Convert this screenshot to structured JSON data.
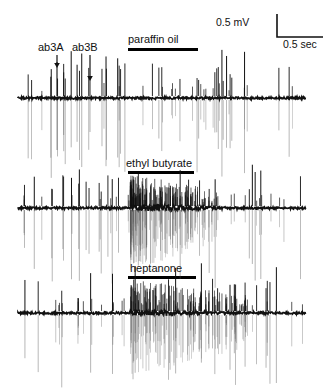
{
  "figure": {
    "title_visible": false,
    "background": "#ffffff",
    "trace_color": "#111111"
  },
  "scale_bar": {
    "voltage_label": "0.5 mV",
    "time_label": "0.5 sec",
    "voltage_value": 0.5,
    "voltage_unit": "mV",
    "time_value": 0.5,
    "time_unit": "sec"
  },
  "neuron_labels": [
    {
      "label": "ab3A",
      "name": "ab3A"
    },
    {
      "label": "ab3B",
      "name": "ab3B"
    }
  ],
  "traces": [
    {
      "id": "trace-paraffin-oil",
      "stimulus": "paraffin oil",
      "index": 1,
      "response": "no increase in firing; baseline spontaneous activity maintained"
    },
    {
      "id": "trace-ethyl-butyrate",
      "stimulus": "ethyl butyrate",
      "index": 2,
      "response": "strong transient burst of high-frequency spikes at stimulus onset"
    },
    {
      "id": "trace-heptanone",
      "stimulus": "heptanone",
      "index": 3,
      "response": "sustained dense high-frequency firing during and after stimulus"
    }
  ],
  "chart_data": {
    "type": "line",
    "title": "",
    "xlabel": "",
    "ylabel": "",
    "subtitle": "",
    "legend": [],
    "grid": false,
    "x_scale": {
      "label": "0.5 sec",
      "value": 0.5,
      "unit": "sec"
    },
    "y_scale": {
      "label": "0.5 mV",
      "value": 0.5,
      "unit": "mV"
    },
    "series": [
      {
        "name": "paraffin oil",
        "stimulus_onset_fraction": 0.39,
        "stimulus_offset_fraction": 0.63,
        "burst": false,
        "burst_intensity": 0
      },
      {
        "name": "ethyl butyrate",
        "stimulus_onset_fraction": 0.39,
        "stimulus_offset_fraction": 0.62,
        "burst": true,
        "burst_intensity": 1.0
      },
      {
        "name": "heptanone",
        "stimulus_onset_fraction": 0.39,
        "stimulus_offset_fraction": 0.63,
        "burst": true,
        "burst_intensity": 0.8
      }
    ],
    "annotations": [
      {
        "text": "ab3A",
        "points_to": "large-amplitude spike"
      },
      {
        "text": "ab3B",
        "points_to": "small-amplitude spike"
      }
    ]
  }
}
